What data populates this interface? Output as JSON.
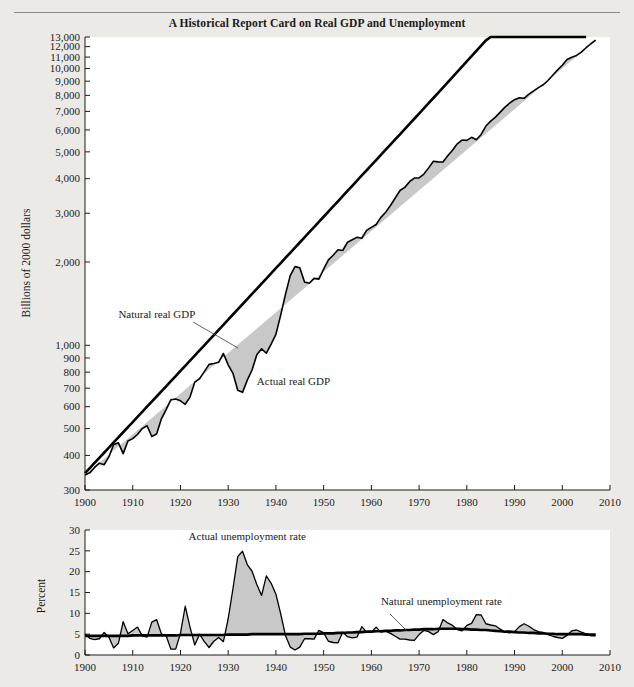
{
  "figure": {
    "title": "A Historical Report Card on Real GDP and Unemployment",
    "background_color": "#eceae6",
    "plot_background_color": "#ffffff",
    "line_color": "#000000",
    "fill_color": "#c8c8c8"
  },
  "chart_data": [
    {
      "id": "gdp",
      "type": "line",
      "title": "",
      "xlabel": "",
      "ylabel": "Billions of 2000 dollars",
      "yscale": "log",
      "ylim": [
        300,
        13000
      ],
      "xlim": [
        1900,
        2010
      ],
      "grid": false,
      "legend": "annotations",
      "yticks": [
        300,
        400,
        500,
        600,
        700,
        800,
        900,
        1000,
        2000,
        3000,
        4000,
        5000,
        6000,
        7000,
        8000,
        9000,
        10000,
        11000,
        12000,
        13000
      ],
      "ytick_labels": [
        "300",
        "400",
        "500",
        "600",
        "700",
        "800",
        "900",
        "1,000",
        "2,000",
        "3,000",
        "4,000",
        "5,000",
        "6,000",
        "7,000",
        "8,000",
        "9,000",
        "10,000",
        "11,000",
        "12,000",
        "13,000"
      ],
      "xticks": [
        1900,
        1910,
        1920,
        1930,
        1940,
        1950,
        1960,
        1970,
        1980,
        1990,
        2000,
        2010
      ],
      "xtick_labels": [
        "1900",
        "1910",
        "1920",
        "1930",
        "1940",
        "1950",
        "1960",
        "1970",
        "1980",
        "1990",
        "2000",
        "2010"
      ],
      "annotations": [
        {
          "text": "Natural real GDP",
          "x": 1907,
          "y": 1250
        },
        {
          "text": "Actual real GDP",
          "x": 1936,
          "y": 720
        }
      ],
      "x": [
        1900,
        1901,
        1902,
        1903,
        1904,
        1905,
        1906,
        1907,
        1908,
        1909,
        1910,
        1911,
        1912,
        1913,
        1914,
        1915,
        1916,
        1917,
        1918,
        1919,
        1920,
        1921,
        1922,
        1923,
        1924,
        1925,
        1926,
        1927,
        1928,
        1929,
        1930,
        1931,
        1932,
        1933,
        1934,
        1935,
        1936,
        1937,
        1938,
        1939,
        1940,
        1941,
        1942,
        1943,
        1944,
        1945,
        1946,
        1947,
        1948,
        1949,
        1950,
        1951,
        1952,
        1953,
        1954,
        1955,
        1956,
        1957,
        1958,
        1959,
        1960,
        1961,
        1962,
        1963,
        1964,
        1965,
        1966,
        1967,
        1968,
        1969,
        1970,
        1971,
        1972,
        1973,
        1974,
        1975,
        1976,
        1977,
        1978,
        1979,
        1980,
        1981,
        1982,
        1983,
        1984,
        1985,
        1986,
        1987,
        1988,
        1989,
        1990,
        1991,
        1992,
        1993,
        1994,
        1995,
        1996,
        1997,
        1998,
        1999,
        2000,
        2001,
        2002,
        2003,
        2004,
        2005,
        2006,
        2007
      ],
      "series": [
        {
          "name": "Actual real GDP",
          "values": [
            340,
            346,
            362,
            375,
            370,
            395,
            438,
            444,
            406,
            451,
            460,
            476,
            500,
            512,
            468,
            478,
            542,
            586,
            636,
            640,
            630,
            612,
            650,
            736,
            757,
            803,
            853,
            860,
            868,
            934,
            850,
            792,
            688,
            676,
            748,
            814,
            924,
            971,
            936,
            1010,
            1095,
            1285,
            1527,
            1785,
            1924,
            1905,
            1693,
            1675,
            1745,
            1734,
            1885,
            2035,
            2116,
            2213,
            2200,
            2357,
            2407,
            2456,
            2436,
            2603,
            2667,
            2733,
            2898,
            3025,
            3200,
            3405,
            3626,
            3721,
            3900,
            4022,
            4028,
            4158,
            4376,
            4624,
            4601,
            4593,
            4841,
            5063,
            5345,
            5515,
            5502,
            5643,
            5527,
            5780,
            6198,
            6453,
            6674,
            6958,
            7252,
            7506,
            7717,
            7843,
            7807,
            8077,
            8298,
            8530,
            8735,
            9055,
            9460,
            9875,
            10280,
            10780,
            10980,
            11150,
            11460,
            11890,
            12290,
            12670,
            13000
          ]
        },
        {
          "name": "Natural real GDP",
          "values": [
            345,
            360,
            376,
            392,
            409,
            427,
            446,
            465,
            485,
            506,
            528,
            551,
            575,
            600,
            626,
            653,
            681,
            711,
            742,
            774,
            808,
            843,
            880,
            918,
            958,
            1000,
            1043,
            1089,
            1136,
            1186,
            1238,
            1292,
            1348,
            1407,
            1469,
            1533,
            1600,
            1670,
            1743,
            1819,
            1899,
            1982,
            2069,
            2159,
            2254,
            2352,
            2455,
            2563,
            2675,
            2792,
            2914,
            3042,
            3175,
            3314,
            3459,
            3611,
            3769,
            3934,
            4107,
            4287,
            4474,
            4671,
            4875,
            5089,
            5312,
            5544,
            5788,
            6042,
            6307,
            6585,
            6875,
            7178,
            7495,
            7826,
            8172,
            8534,
            8912,
            9308,
            9722,
            10155,
            10607,
            11081,
            11576,
            12094,
            12635,
            13201,
            13793,
            14411,
            15058,
            15734,
            16441,
            17180,
            17953,
            18761,
            19606,
            20489,
            21413,
            22379,
            23389,
            24445,
            25548,
            26702,
            27908,
            29169,
            30488,
            31867
          ]
        }
      ],
      "notes": "Actual real GDP falls far below natural real GDP during the Great Depression (1930-1940) and rises above it during World War II (1942-1945). Natural real GDP is the smooth trend line."
    },
    {
      "id": "unemployment",
      "type": "line",
      "title": "",
      "xlabel": "",
      "ylabel": "Percent",
      "yscale": "linear",
      "ylim": [
        0,
        30
      ],
      "xlim": [
        1900,
        2010
      ],
      "grid": false,
      "legend": "annotations",
      "yticks": [
        0,
        5,
        10,
        15,
        20,
        25,
        30
      ],
      "ytick_labels": [
        "0",
        "5",
        "10",
        "15",
        "20",
        "25",
        "30"
      ],
      "xticks": [
        1900,
        1910,
        1920,
        1930,
        1940,
        1950,
        1960,
        1970,
        1980,
        1990,
        2000,
        2010
      ],
      "xtick_labels": [
        "1900",
        "1910",
        "1920",
        "1930",
        "1940",
        "1950",
        "1960",
        "1970",
        "1980",
        "1990",
        "2000",
        "2010"
      ],
      "annotations": [
        {
          "text": "Actual unemployment rate",
          "x": 1934,
          "y": 27.5
        },
        {
          "text": "Natural unemployment rate",
          "x": 1962,
          "y": 12.0
        }
      ],
      "x": [
        1900,
        1901,
        1902,
        1903,
        1904,
        1905,
        1906,
        1907,
        1908,
        1909,
        1910,
        1911,
        1912,
        1913,
        1914,
        1915,
        1916,
        1917,
        1918,
        1919,
        1920,
        1921,
        1922,
        1923,
        1924,
        1925,
        1926,
        1927,
        1928,
        1929,
        1930,
        1931,
        1932,
        1933,
        1934,
        1935,
        1936,
        1937,
        1938,
        1939,
        1940,
        1941,
        1942,
        1943,
        1944,
        1945,
        1946,
        1947,
        1948,
        1949,
        1950,
        1951,
        1952,
        1953,
        1954,
        1955,
        1956,
        1957,
        1958,
        1959,
        1960,
        1961,
        1962,
        1963,
        1964,
        1965,
        1966,
        1967,
        1968,
        1969,
        1970,
        1971,
        1972,
        1973,
        1974,
        1975,
        1976,
        1977,
        1978,
        1979,
        1980,
        1981,
        1982,
        1983,
        1984,
        1985,
        1986,
        1987,
        1988,
        1989,
        1990,
        1991,
        1992,
        1993,
        1994,
        1995,
        1996,
        1997,
        1998,
        1999,
        2000,
        2001,
        2002,
        2003,
        2004,
        2005,
        2006,
        2007
      ],
      "series": [
        {
          "name": "Actual unemployment rate",
          "values": [
            5.0,
            4.0,
            3.7,
            3.9,
            5.4,
            4.3,
            1.7,
            2.8,
            8.0,
            5.1,
            5.9,
            6.7,
            4.6,
            4.3,
            7.9,
            8.5,
            5.1,
            4.6,
            1.4,
            1.4,
            5.2,
            11.7,
            6.7,
            2.4,
            5.0,
            3.2,
            1.8,
            3.3,
            4.2,
            3.2,
            8.7,
            15.9,
            23.6,
            24.9,
            21.7,
            20.1,
            16.9,
            14.3,
            19.0,
            17.2,
            14.6,
            9.9,
            4.7,
            1.9,
            1.2,
            1.9,
            3.9,
            3.9,
            3.8,
            5.9,
            5.3,
            3.3,
            3.0,
            2.9,
            5.5,
            4.4,
            4.1,
            4.3,
            6.8,
            5.5,
            5.5,
            6.7,
            5.5,
            5.7,
            5.2,
            4.5,
            3.8,
            3.8,
            3.6,
            3.5,
            4.9,
            5.9,
            5.6,
            4.9,
            5.6,
            8.5,
            7.7,
            7.1,
            6.1,
            5.8,
            7.1,
            7.6,
            9.7,
            9.6,
            7.5,
            7.2,
            7.0,
            6.2,
            5.5,
            5.3,
            5.6,
            6.8,
            7.5,
            6.9,
            6.1,
            5.6,
            5.4,
            4.9,
            4.5,
            4.2,
            4.0,
            4.7,
            5.8,
            6.0,
            5.5,
            5.1,
            4.6,
            4.6
          ]
        },
        {
          "name": "Natural unemployment rate",
          "values": [
            4.6,
            4.6,
            4.6,
            4.6,
            4.6,
            4.6,
            4.6,
            4.6,
            4.6,
            4.6,
            4.7,
            4.7,
            4.7,
            4.7,
            4.7,
            4.7,
            4.7,
            4.7,
            4.7,
            4.7,
            4.8,
            4.8,
            4.8,
            4.8,
            4.8,
            4.8,
            4.8,
            4.8,
            4.8,
            4.8,
            4.9,
            4.9,
            4.9,
            4.9,
            4.9,
            5.0,
            5.0,
            5.0,
            5.0,
            5.0,
            5.0,
            5.0,
            5.0,
            5.0,
            5.0,
            5.0,
            5.1,
            5.1,
            5.1,
            5.1,
            5.2,
            5.2,
            5.2,
            5.3,
            5.3,
            5.4,
            5.4,
            5.5,
            5.5,
            5.6,
            5.6,
            5.7,
            5.7,
            5.8,
            5.8,
            5.9,
            5.9,
            6.0,
            6.0,
            6.1,
            6.1,
            6.2,
            6.2,
            6.2,
            6.3,
            6.3,
            6.3,
            6.3,
            6.3,
            6.2,
            6.2,
            6.1,
            6.1,
            6.0,
            6.0,
            5.9,
            5.8,
            5.7,
            5.6,
            5.6,
            5.5,
            5.4,
            5.4,
            5.3,
            5.3,
            5.2,
            5.2,
            5.1,
            5.1,
            5.0,
            5.0,
            5.0,
            5.0,
            5.0,
            5.0,
            4.9,
            4.9,
            4.9
          ]
        }
      ],
      "notes": "Actual unemployment peaks near 25 percent in 1933 during the Great Depression and falls near 1 percent during World War II. The natural unemployment rate is a smooth line near 5 percent."
    }
  ]
}
